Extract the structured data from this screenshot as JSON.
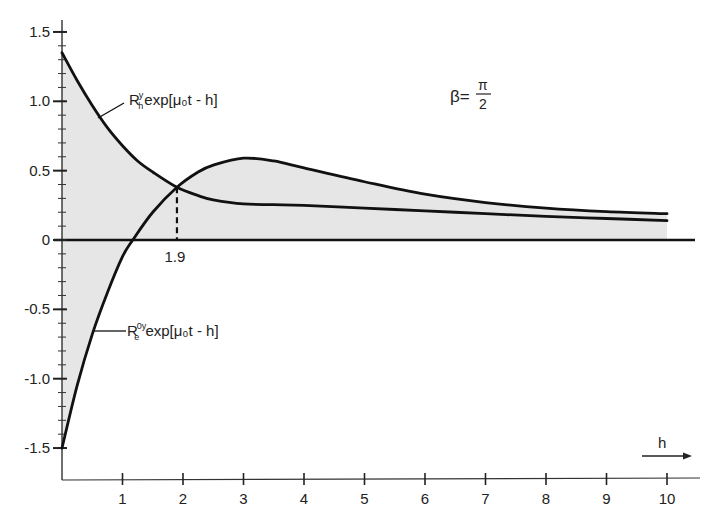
{
  "chart_data": {
    "type": "line",
    "title": "",
    "xlabel": "h",
    "ylabel": "",
    "xlim": [
      0,
      10.5
    ],
    "ylim": [
      -1.6,
      1.6
    ],
    "grid": false,
    "x_ticks": [
      1,
      2,
      3,
      4,
      5,
      6,
      7,
      8,
      9,
      10
    ],
    "x_tick_labels": [
      "1",
      "2",
      "3",
      "4",
      "5",
      "6",
      "7",
      "8",
      "9",
      "10"
    ],
    "y_ticks": [
      1.5,
      1.0,
      0.5,
      0,
      -0.5,
      -1.0,
      -1.5
    ],
    "y_tick_labels": [
      "1.5",
      "1.0",
      "0.5",
      "0",
      "-0.5",
      "-1.0",
      "-1.5"
    ],
    "y_minor_step": 0.1,
    "fill": "area between each curve and zero line shaded light gray",
    "series": [
      {
        "name": "R_h^y exp[μ0 t - h]",
        "label_main": "R",
        "label_sup": "y",
        "label_sub": "h",
        "label_rest": "exp[μ₀t - h]",
        "x": [
          0,
          0.25,
          0.5,
          0.75,
          1,
          1.25,
          1.5,
          1.9,
          2.25,
          2.5,
          3,
          3.5,
          4,
          5,
          6,
          7,
          8,
          9,
          10
        ],
        "values": [
          1.35,
          1.15,
          0.97,
          0.81,
          0.68,
          0.57,
          0.49,
          0.38,
          0.32,
          0.29,
          0.26,
          0.255,
          0.25,
          0.23,
          0.21,
          0.19,
          0.17,
          0.155,
          0.14
        ]
      },
      {
        "name": "R_e^0y exp[μ0 t - h]",
        "label_main": "R",
        "label_sup": "0y",
        "label_sub": "e",
        "label_rest": "exp[μ₀t - h]",
        "x": [
          0,
          0.25,
          0.5,
          0.75,
          1,
          1.17,
          1.5,
          1.9,
          2.25,
          2.5,
          3,
          3.5,
          4,
          5,
          6,
          7,
          8,
          9,
          10
        ],
        "values": [
          -1.5,
          -1.05,
          -0.68,
          -0.38,
          -0.12,
          0,
          0.2,
          0.38,
          0.49,
          0.54,
          0.59,
          0.57,
          0.52,
          0.42,
          0.33,
          0.27,
          0.23,
          0.205,
          0.19
        ]
      }
    ],
    "annotations": [
      {
        "text": "β=π/2",
        "beta": "β=",
        "num": "π",
        "den": "2",
        "x": 7.0,
        "y": 0.95
      },
      {
        "text": "1.9",
        "type": "dashed vertical line at intersection",
        "x": 1.9,
        "y": 0.38
      }
    ],
    "axis_arrow_label": "h"
  }
}
